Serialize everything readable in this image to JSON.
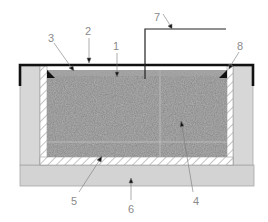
{
  "diagram": {
    "type": "cross-section",
    "colors": {
      "background": "#ffffff",
      "outer_wall": "#d6d6d6",
      "outer_wall_stroke": "#9a9a9a",
      "base": "#d2d2d2",
      "hatch_fill": "#ffffff",
      "hatch_line": "#c8c8c8",
      "core": "#8c8c8c",
      "cover": "#111111",
      "leader": "#777777",
      "label": "#8a8a8a"
    },
    "labels": [
      {
        "id": "1",
        "text": "1",
        "x": 115,
        "y": 48,
        "target": [
          117,
          77
        ]
      },
      {
        "id": "2",
        "text": "2",
        "x": 86,
        "y": 33,
        "target": [
          89,
          62
        ]
      },
      {
        "id": "3",
        "text": "3",
        "x": 50,
        "y": 40,
        "target": [
          73,
          70
        ]
      },
      {
        "id": "4",
        "text": "4",
        "x": 197,
        "y": 203,
        "target": [
          181,
          124
        ]
      },
      {
        "id": "5",
        "text": "5",
        "x": 74,
        "y": 203,
        "target": [
          101,
          158
        ]
      },
      {
        "id": "6",
        "text": "6",
        "x": 131,
        "y": 211,
        "target": [
          131,
          180
        ]
      },
      {
        "id": "7",
        "text": "7",
        "x": 157,
        "y": 19,
        "target": [
          171,
          28
        ]
      },
      {
        "id": "8",
        "text": "8",
        "x": 239,
        "y": 48,
        "target": [
          230,
          68
        ]
      }
    ]
  }
}
